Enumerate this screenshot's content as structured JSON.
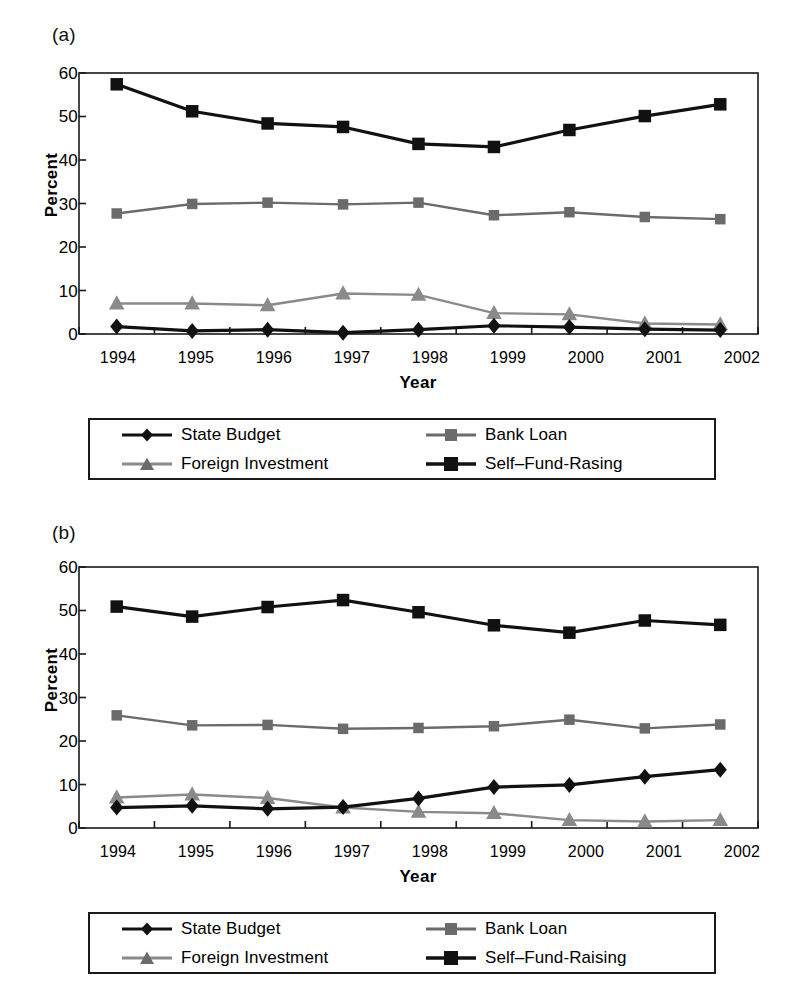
{
  "figure": {
    "panels": [
      {
        "tag": "(a)",
        "name": "panel-a"
      },
      {
        "tag": "(b)",
        "name": "panel-b"
      }
    ]
  },
  "axis": {
    "ylabel": "Percent",
    "xlabel": "Year",
    "yticks": [
      "60",
      "50",
      "40",
      "30",
      "20",
      "10",
      "0"
    ],
    "xticks": [
      "1994",
      "1995",
      "1996",
      "1997",
      "1998",
      "1999",
      "2000",
      "2001",
      "2002"
    ]
  },
  "legend_a": {
    "items": [
      {
        "label": "State Budget",
        "marker": "diamond-marker",
        "color": "#111111",
        "line": "#111111"
      },
      {
        "label": "Bank Loan",
        "marker": "square-marker",
        "color": "#6b6b6b",
        "line": "#6b6b6b"
      },
      {
        "label": "Foreign Investment",
        "marker": "triangle-marker",
        "color": "#6b6b6b",
        "line": "#8a8a8a"
      },
      {
        "label": "Self–Fund-Rasing",
        "marker": "square-marker",
        "color": "#111111",
        "line": "#111111"
      }
    ]
  },
  "legend_b": {
    "items": [
      {
        "label": "State Budget",
        "marker": "diamond-marker",
        "color": "#111111",
        "line": "#111111"
      },
      {
        "label": "Bank Loan",
        "marker": "square-marker",
        "color": "#6b6b6b",
        "line": "#6b6b6b"
      },
      {
        "label": "Foreign Investment",
        "marker": "triangle-marker",
        "color": "#6b6b6b",
        "line": "#8a8a8a"
      },
      {
        "label": "Self–Fund-Raising",
        "marker": "square-marker",
        "color": "#111111",
        "line": "#111111"
      }
    ]
  },
  "chart_data": [
    {
      "type": "line",
      "panel": "(a)",
      "title": "",
      "xlabel": "Year",
      "ylabel": "Percent",
      "ylim": [
        0,
        60
      ],
      "yticks": [
        0,
        10,
        20,
        30,
        40,
        50,
        60
      ],
      "grid": false,
      "legend_position": "below",
      "categories": [
        "1994",
        "1995",
        "1996",
        "1997",
        "1998",
        "1999",
        "2000",
        "2001",
        "2002"
      ],
      "series": [
        {
          "name": "State Budget",
          "marker": "diamond",
          "color": "#111111",
          "values": [
            1.7,
            0.7,
            1.0,
            0.3,
            1.0,
            1.9,
            1.6,
            1.1,
            0.9
          ]
        },
        {
          "name": "Bank Loan",
          "marker": "square",
          "color": "#6b6b6b",
          "values": [
            27.7,
            29.9,
            30.2,
            29.8,
            30.2,
            27.3,
            28.0,
            26.9,
            26.4
          ]
        },
        {
          "name": "Foreign Investment",
          "marker": "triangle",
          "color": "#8a8a8a",
          "values": [
            7.0,
            7.0,
            6.6,
            9.3,
            9.0,
            4.8,
            4.5,
            2.4,
            2.2
          ]
        },
        {
          "name": "Self–Fund-Rasing",
          "marker": "square",
          "color": "#111111",
          "values": [
            57.4,
            51.2,
            48.4,
            47.6,
            43.7,
            43.0,
            46.9,
            50.1,
            52.8
          ]
        }
      ]
    },
    {
      "type": "line",
      "panel": "(b)",
      "title": "",
      "xlabel": "Year",
      "ylabel": "Percent",
      "ylim": [
        0,
        60
      ],
      "yticks": [
        0,
        10,
        20,
        30,
        40,
        50,
        60
      ],
      "grid": false,
      "legend_position": "below",
      "categories": [
        "1994",
        "1995",
        "1996",
        "1997",
        "1998",
        "1999",
        "2000",
        "2001",
        "2002"
      ],
      "series": [
        {
          "name": "State Budget",
          "marker": "diamond",
          "color": "#111111",
          "values": [
            4.7,
            5.1,
            4.4,
            4.8,
            6.8,
            9.4,
            9.9,
            11.8,
            13.4
          ]
        },
        {
          "name": "Bank Loan",
          "marker": "square",
          "color": "#6b6b6b",
          "values": [
            25.9,
            23.6,
            23.7,
            22.8,
            23.0,
            23.4,
            24.9,
            22.9,
            23.8
          ]
        },
        {
          "name": "Foreign Investment",
          "marker": "triangle",
          "color": "#8a8a8a",
          "values": [
            7.0,
            7.7,
            6.9,
            4.7,
            3.7,
            3.4,
            1.8,
            1.5,
            1.8
          ]
        },
        {
          "name": "Self–Fund-Raising",
          "marker": "square",
          "color": "#111111",
          "values": [
            50.9,
            48.6,
            50.8,
            52.4,
            49.6,
            46.6,
            44.9,
            47.7,
            46.7
          ]
        }
      ]
    }
  ]
}
